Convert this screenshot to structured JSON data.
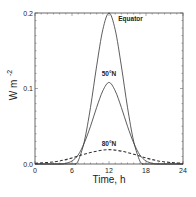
{
  "chart_data": {
    "type": "line",
    "title": "",
    "xlabel": "Time, h",
    "ylabel": "W m",
    "ylabel_exponent": "-2",
    "xlim": [
      0,
      24
    ],
    "ylim": [
      0,
      0.2
    ],
    "xticks": [
      0,
      6,
      12,
      18,
      24
    ],
    "xtick_labels": [
      "0",
      "6",
      "12",
      "18",
      "24"
    ],
    "yticks": [
      0,
      0.1,
      0.2
    ],
    "ytick_labels": [
      "0.0",
      "0.1",
      "0.2"
    ],
    "grid": false,
    "legend": "none (curves annotated inline)",
    "series": [
      {
        "name": "Equator",
        "style": "solid",
        "peak_x": 12,
        "peak_y": 0.2,
        "start_x": 6.5,
        "end_x": 17.5,
        "x": [
          0,
          6,
          6.5,
          7,
          8,
          9,
          10,
          11,
          12,
          13,
          14,
          15,
          16,
          17,
          17.5,
          18,
          24
        ],
        "y": [
          0,
          0,
          0,
          0.004,
          0.03,
          0.075,
          0.13,
          0.178,
          0.2,
          0.178,
          0.13,
          0.075,
          0.03,
          0.004,
          0,
          0,
          0
        ]
      },
      {
        "name": "50°N",
        "style": "solid",
        "peak_x": 12,
        "peak_y": 0.108,
        "x": [
          0,
          4,
          5,
          6,
          7,
          8,
          9,
          10,
          11,
          12,
          13,
          14,
          15,
          16,
          17,
          18,
          19,
          20,
          24
        ],
        "y": [
          0,
          0,
          0.001,
          0.004,
          0.012,
          0.028,
          0.05,
          0.075,
          0.097,
          0.108,
          0.097,
          0.075,
          0.05,
          0.028,
          0.012,
          0.004,
          0.001,
          0,
          0
        ]
      },
      {
        "name": "80°N",
        "style": "dashed",
        "peak_x": 12,
        "peak_y": 0.019,
        "x": [
          0,
          2,
          4,
          6,
          8,
          10,
          12,
          14,
          16,
          18,
          20,
          22,
          24
        ],
        "y": [
          0.001,
          0.002,
          0.004,
          0.008,
          0.013,
          0.017,
          0.019,
          0.017,
          0.013,
          0.008,
          0.004,
          0.002,
          0.001
        ]
      }
    ],
    "annotations": [
      {
        "text": "Equator",
        "x": 13.5,
        "y": 0.19
      },
      {
        "text": "50°N",
        "x": 12,
        "y": 0.116
      },
      {
        "text": "80°N",
        "x": 12,
        "y": 0.024
      }
    ]
  }
}
